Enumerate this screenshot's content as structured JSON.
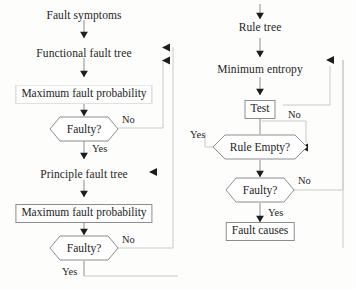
{
  "diagram": {
    "stroke_color": "#8d8d8d",
    "faint_stroke_color": "#c9c9c9",
    "text_color": "#1d1d1d",
    "background_color": "#fdfdfc",
    "left_branch": {
      "start_label": "Fault symptoms",
      "functional_tree_label": "Functional fault tree",
      "max_prob_label_1": "Maximum fault probability",
      "decision_1_label": "Faulty?",
      "decision_1_no": "No",
      "decision_1_yes": "Yes",
      "principle_tree_label": "Principle fault tree",
      "max_prob_label_2": "Maximum fault probability",
      "decision_2_label": "Faulty?",
      "decision_2_no": "No",
      "decision_2_yes": "Yes"
    },
    "right_branch": {
      "rule_tree_label": "Rule tree",
      "min_entropy_label": "Minimum entropy",
      "test_label": "Test",
      "rule_empty_label": "Rule Empty?",
      "rule_empty_no": "No",
      "rule_empty_yes": "Yes",
      "decision_label": "Faulty?",
      "decision_no": "No",
      "decision_yes": "Yes",
      "result_label": "Fault causes"
    }
  }
}
